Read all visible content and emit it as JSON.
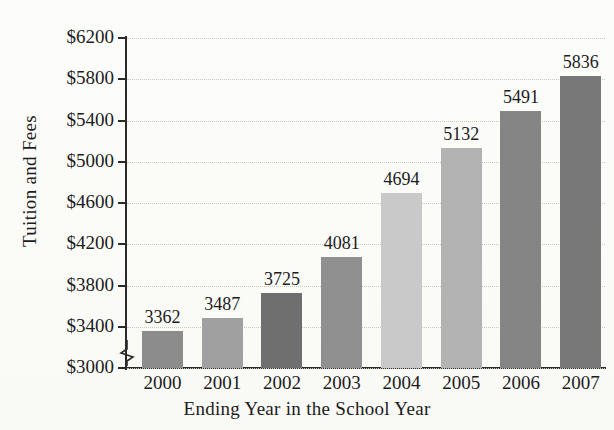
{
  "chart_data": {
    "type": "bar",
    "title": "",
    "xlabel": "Ending Year in the School Year",
    "ylabel": "Tuition and Fees",
    "categories": [
      "2000",
      "2001",
      "2002",
      "2003",
      "2004",
      "2005",
      "2006",
      "2007"
    ],
    "values": [
      3362,
      3487,
      3725,
      4081,
      4694,
      5132,
      5491,
      5836
    ],
    "value_labels": [
      "3362",
      "3487",
      "3725",
      "4081",
      "4694",
      "5132",
      "5491",
      "5836"
    ],
    "ylim": [
      3000,
      6200
    ],
    "ytick_values": [
      3000,
      3400,
      3800,
      4200,
      4600,
      5000,
      5400,
      5800,
      6200
    ],
    "ytick_labels": [
      "$3000",
      "$3400",
      "$3800",
      "$4200",
      "$4600",
      "$5000",
      "$5400",
      "$5800",
      "$6200"
    ],
    "ytick_step": 400,
    "axis_break": true,
    "axis_break_note": "zigzag break on y-axis below $3000",
    "grid": "horizontal-dotted",
    "legend": "none",
    "bar_colors": [
      "#8c8c8c",
      "#a0a0a0",
      "#6f6f6f",
      "#909090",
      "#c9c9c9",
      "#b3b3b3",
      "#858585",
      "#787878"
    ],
    "bar_baseline_value": 3000
  },
  "axes": {
    "axis_color": "#2a2a2a",
    "grid_color": "#c9c9c4"
  },
  "background": {
    "page_color": "#fdfdfb"
  }
}
